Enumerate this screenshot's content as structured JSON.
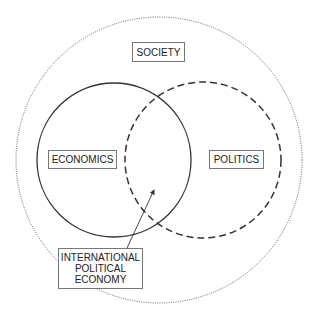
{
  "diagram": {
    "colors": {
      "stroke": "#333333",
      "outer_stroke": "#555555",
      "box_border": "#777777",
      "text": "#222222"
    },
    "outer_circle": {
      "label": "SOCIETY",
      "style": "dotted"
    },
    "left_circle": {
      "label": "ECONOMICS",
      "style": "solid"
    },
    "right_circle": {
      "label": "POLITICS",
      "style": "dashed"
    },
    "intersection": {
      "label_lines": [
        "INTERNATIONAL",
        "POLITICAL",
        "ECONOMY"
      ],
      "pointer": "arrow"
    }
  }
}
